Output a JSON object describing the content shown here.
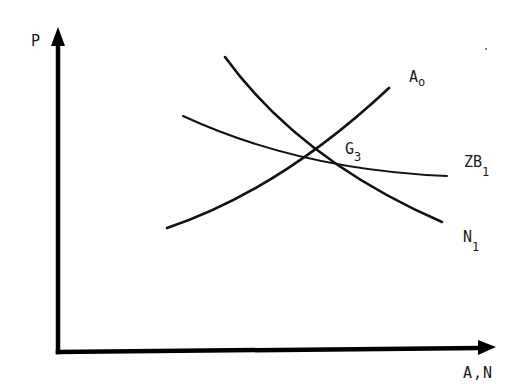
{
  "diagram": {
    "axes": {
      "y_label": "P",
      "x_label": "A,N"
    },
    "curves": [
      {
        "id": "A0",
        "label_main": "A",
        "label_sub": "o",
        "shape": "upward-sloping convex"
      },
      {
        "id": "N1",
        "label_main": "N",
        "label_sub": "1",
        "shape": "downward-sloping convex"
      },
      {
        "id": "ZB1",
        "label_main": "ZB",
        "label_sub": "1",
        "shape": "gently downward-sloping, flattening"
      }
    ],
    "points": [
      {
        "id": "G3",
        "label_main": "G",
        "label_sub": "3",
        "description": "intersection of N1 and ZB1"
      }
    ],
    "colors": {
      "ink": "#111111",
      "background": "#ffffff"
    }
  }
}
